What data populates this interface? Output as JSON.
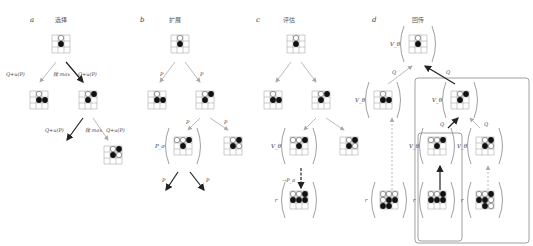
{
  "panels": [
    {
      "id": "a",
      "letter": "a",
      "title": "选择",
      "letter_x": 30,
      "title_x": 61
    },
    {
      "id": "b",
      "letter": "b",
      "title": "扩展",
      "letter_x": 140,
      "title_x": 175
    },
    {
      "id": "c",
      "letter": "c",
      "title": "评估",
      "letter_x": 256,
      "title_x": 289
    },
    {
      "id": "d",
      "letter": "d",
      "title": "回传",
      "letter_x": 372,
      "title_x": 418
    }
  ],
  "colors": {
    "line": "#999999",
    "arrow_dark": "#222222",
    "arrow_light": "#aaaaaa",
    "black_stone": "#111111",
    "white_stone": "#ffffff",
    "box": "#888888"
  },
  "boards": [
    {
      "id": "a-root",
      "x": 61,
      "y": 44,
      "w": [
        "1,0"
      ],
      "b": [
        "1,1"
      ]
    },
    {
      "id": "a-l",
      "x": 39,
      "y": 100,
      "w": [
        "1,0"
      ],
      "b": [
        "1,1",
        "2,1"
      ]
    },
    {
      "id": "a-r",
      "x": 88,
      "y": 100,
      "w": [
        "1,0"
      ],
      "b": [
        "1,1",
        "2,0"
      ]
    },
    {
      "id": "a-rr",
      "x": 113,
      "y": 155,
      "w": [
        "1,0",
        "2,1"
      ],
      "b": [
        "1,1",
        "2,0"
      ]
    },
    {
      "id": "b-root",
      "x": 180,
      "y": 44,
      "w": [
        "1,0"
      ],
      "b": [
        "1,1"
      ]
    },
    {
      "id": "b-l",
      "x": 157,
      "y": 100,
      "w": [
        "1,0"
      ],
      "b": [
        "1,1",
        "2,1"
      ]
    },
    {
      "id": "b-r",
      "x": 205,
      "y": 100,
      "w": [
        "1,0"
      ],
      "b": [
        "1,1",
        "2,0"
      ]
    },
    {
      "id": "b-rl",
      "x": 183,
      "y": 146,
      "w": [
        "0,0",
        "1,0"
      ],
      "b": [
        "1,1",
        "2,0"
      ]
    },
    {
      "id": "b-rr",
      "x": 233,
      "y": 146,
      "w": [
        "1,0",
        "2,1"
      ],
      "b": [
        "1,1",
        "2,0"
      ]
    },
    {
      "id": "c-root",
      "x": 296,
      "y": 44,
      "w": [
        "1,0"
      ],
      "b": [
        "1,1"
      ]
    },
    {
      "id": "c-l",
      "x": 273,
      "y": 100,
      "w": [
        "1,0"
      ],
      "b": [
        "1,1",
        "2,1"
      ]
    },
    {
      "id": "c-r",
      "x": 321,
      "y": 100,
      "w": [
        "1,0"
      ],
      "b": [
        "1,1",
        "2,0"
      ]
    },
    {
      "id": "c-rl",
      "x": 299,
      "y": 146,
      "w": [
        "0,0",
        "1,0"
      ],
      "b": [
        "1,1",
        "2,0"
      ]
    },
    {
      "id": "c-rr",
      "x": 349,
      "y": 146,
      "w": [
        "1,0",
        "2,1"
      ],
      "b": [
        "1,1",
        "2,0"
      ]
    },
    {
      "id": "c-leaf",
      "x": 299,
      "y": 200,
      "w": [
        "0,0",
        "1,0"
      ],
      "b": [
        "2,0",
        "0,1",
        "1,1",
        "2,1"
      ]
    },
    {
      "id": "d-root",
      "x": 418,
      "y": 44,
      "w": [
        "1,0"
      ],
      "b": [
        "1,1"
      ]
    },
    {
      "id": "d-l",
      "x": 383,
      "y": 100,
      "w": [
        "1,0"
      ],
      "b": [
        "1,1",
        "2,1"
      ]
    },
    {
      "id": "d-r",
      "x": 460,
      "y": 100,
      "w": [
        "1,0"
      ],
      "b": [
        "1,1",
        "2,0"
      ]
    },
    {
      "id": "d-rl",
      "x": 437,
      "y": 146,
      "w": [
        "0,0",
        "1,0"
      ],
      "b": [
        "1,1",
        "2,0"
      ]
    },
    {
      "id": "d-rr",
      "x": 485,
      "y": 146,
      "w": [
        "1,0",
        "2,1"
      ],
      "b": [
        "1,1",
        "2,0"
      ]
    },
    {
      "id": "d-leaf1",
      "x": 389,
      "y": 200,
      "w": [
        "0,0",
        "1,0",
        "2,0",
        "0,1"
      ],
      "b": [
        "1,1",
        "2,1",
        "0,2",
        "1,2"
      ]
    },
    {
      "id": "d-leaf2",
      "x": 437,
      "y": 200,
      "w": [
        "0,0",
        "1,0"
      ],
      "b": [
        "2,0",
        "0,1",
        "1,1",
        "2,1"
      ]
    },
    {
      "id": "d-leaf3",
      "x": 485,
      "y": 200,
      "w": [
        "0,0",
        "1,0",
        "2,1",
        "2,2"
      ],
      "b": [
        "2,0",
        "0,1",
        "1,1",
        "1,2"
      ]
    }
  ],
  "parens": [
    {
      "x": 183,
      "y": 146,
      "label": "P_σ"
    },
    {
      "x": 299,
      "y": 146,
      "label": "V_θ"
    },
    {
      "x": 299,
      "y": 200,
      "label": "r"
    },
    {
      "x": 418,
      "y": 44,
      "label": "V_θ"
    },
    {
      "x": 383,
      "y": 100,
      "label": "V_θ"
    },
    {
      "x": 460,
      "y": 100,
      "label": "V_θ"
    },
    {
      "x": 437,
      "y": 146,
      "label": "V_θ"
    },
    {
      "x": 485,
      "y": 146,
      "label": "V_θ"
    },
    {
      "x": 389,
      "y": 200,
      "label": "r"
    },
    {
      "x": 437,
      "y": 200,
      "label": "r"
    },
    {
      "x": 485,
      "y": 200,
      "label": "r"
    }
  ],
  "arrows": [
    {
      "x1": 56,
      "y1": 62,
      "x2": 40,
      "y2": 82,
      "dark": false
    },
    {
      "x1": 66,
      "y1": 62,
      "x2": 83,
      "y2": 82,
      "dark": true
    },
    {
      "x1": 83,
      "y1": 118,
      "x2": 67,
      "y2": 140,
      "dark": true
    },
    {
      "x1": 93,
      "y1": 118,
      "x2": 108,
      "y2": 140,
      "dark": false
    },
    {
      "x1": 175,
      "y1": 62,
      "x2": 160,
      "y2": 82,
      "dark": false
    },
    {
      "x1": 185,
      "y1": 62,
      "x2": 200,
      "y2": 82,
      "dark": false
    },
    {
      "x1": 200,
      "y1": 118,
      "x2": 188,
      "y2": 130,
      "dark": false
    },
    {
      "x1": 210,
      "y1": 118,
      "x2": 228,
      "y2": 130,
      "dark": false
    },
    {
      "x1": 178,
      "y1": 172,
      "x2": 166,
      "y2": 190,
      "dark": true
    },
    {
      "x1": 190,
      "y1": 172,
      "x2": 204,
      "y2": 190,
      "dark": true
    },
    {
      "x1": 291,
      "y1": 62,
      "x2": 276,
      "y2": 82,
      "dark": false
    },
    {
      "x1": 301,
      "y1": 62,
      "x2": 316,
      "y2": 82,
      "dark": false
    },
    {
      "x1": 316,
      "y1": 118,
      "x2": 304,
      "y2": 130,
      "dark": false
    },
    {
      "x1": 326,
      "y1": 118,
      "x2": 344,
      "y2": 130,
      "dark": false
    },
    {
      "x1": 301,
      "y1": 168,
      "x2": 301,
      "y2": 188,
      "dark": true,
      "dashed": true
    },
    {
      "x1": 388,
      "y1": 84,
      "x2": 412,
      "y2": 66,
      "dark": false
    },
    {
      "x1": 455,
      "y1": 84,
      "x2": 425,
      "y2": 66,
      "dark": true
    },
    {
      "x1": 448,
      "y1": 128,
      "x2": 458,
      "y2": 118,
      "dark": true
    },
    {
      "x1": 480,
      "y1": 128,
      "x2": 470,
      "y2": 118,
      "dark": false
    },
    {
      "x1": 392,
      "y1": 190,
      "x2": 392,
      "y2": 118,
      "dark": false,
      "dashed": true
    },
    {
      "x1": 440,
      "y1": 190,
      "x2": 440,
      "y2": 166,
      "dark": true
    },
    {
      "x1": 488,
      "y1": 190,
      "x2": 488,
      "y2": 166,
      "dark": false,
      "dashed": true
    }
  ],
  "edge_labels": [
    {
      "x": 6,
      "y": 76,
      "text": "Q+u(P)"
    },
    {
      "x": 53,
      "y": 76,
      "text": "找 max"
    },
    {
      "x": 78,
      "y": 76,
      "text": "Q+u(P)"
    },
    {
      "x": 45,
      "y": 132,
      "text": "Q+u(P)"
    },
    {
      "x": 85,
      "y": 132,
      "text": "找 max"
    },
    {
      "x": 106,
      "y": 132,
      "text": "Q+u(P)"
    },
    {
      "x": 160,
      "y": 76,
      "text": "P"
    },
    {
      "x": 200,
      "y": 76,
      "text": "P"
    },
    {
      "x": 186,
      "y": 124,
      "text": "P"
    },
    {
      "x": 224,
      "y": 124,
      "text": "P"
    },
    {
      "x": 162,
      "y": 182,
      "text": "P"
    },
    {
      "x": 206,
      "y": 182,
      "text": "P"
    },
    {
      "x": 282,
      "y": 182,
      "text": "→P_π"
    },
    {
      "x": 392,
      "y": 74,
      "text": "Q"
    },
    {
      "x": 446,
      "y": 74,
      "text": "Q"
    },
    {
      "x": 440,
      "y": 126,
      "text": "Q"
    },
    {
      "x": 484,
      "y": 126,
      "text": "Q"
    }
  ],
  "boxes": [
    {
      "id": "backup-outer",
      "x": 415,
      "y": 78,
      "w": 114,
      "h": 165
    },
    {
      "id": "backup-inner",
      "x": 418,
      "y": 133,
      "w": 44,
      "h": 108
    }
  ]
}
